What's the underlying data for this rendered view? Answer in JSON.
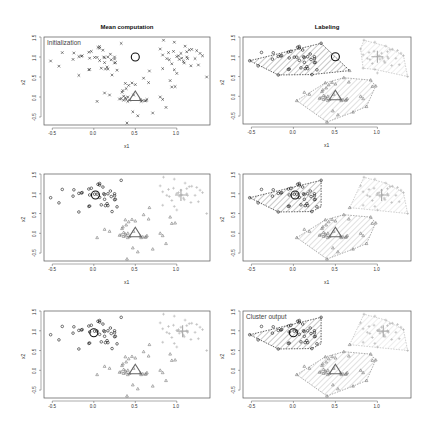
{
  "figure": {
    "column_titles": [
      "Mean computation",
      "Labeling"
    ],
    "panel_labels": {
      "initialization": "Initialization",
      "output": "Cluster output"
    },
    "xlabel": "x1",
    "ylabel": "x2",
    "bottom_left_xlabel": "-",
    "bottom_right_xlabel": "-"
  },
  "chart_data": [
    {
      "type": "scatter",
      "title": "Mean computation",
      "subtitle": "Initialization",
      "xlabel": "x1",
      "ylabel": "x2",
      "xlim": [
        -0.6,
        1.4
      ],
      "ylim": [
        -0.7,
        1.5
      ],
      "xticks": [
        -0.5,
        0.0,
        0.5,
        1.0
      ],
      "yticks": [
        -0.5,
        0.0,
        0.5,
        1.0,
        1.5
      ],
      "point_style": "unlabeled-x",
      "centroids": [
        {
          "x": 0.5,
          "y": 1.0,
          "marker": "circle"
        },
        {
          "x": 0.5,
          "y": 0.0,
          "marker": "triangle"
        }
      ]
    },
    {
      "type": "scatter",
      "title": "Labeling",
      "xlabel": "x1",
      "ylabel": "x2",
      "xlim": [
        -0.6,
        1.4
      ],
      "ylim": [
        -0.7,
        1.5
      ],
      "hulls": true,
      "centroids": [
        {
          "x": 0.5,
          "y": 1.0,
          "marker": "circle"
        },
        {
          "x": 0.5,
          "y": 0.0,
          "marker": "triangle"
        },
        {
          "x": 1.0,
          "y": 1.0,
          "marker": "plus"
        }
      ]
    },
    {
      "type": "scatter",
      "xlabel": "x1",
      "ylabel": "x2",
      "xlim": [
        -0.6,
        1.4
      ],
      "ylim": [
        -0.7,
        1.5
      ],
      "centroids": [
        {
          "x": 0.02,
          "y": 0.97,
          "marker": "circle"
        },
        {
          "x": 0.5,
          "y": 0.0,
          "marker": "triangle"
        },
        {
          "x": 1.05,
          "y": 0.97,
          "marker": "plus"
        }
      ]
    },
    {
      "type": "scatter",
      "xlabel": "x1",
      "ylabel": "x2",
      "xlim": [
        -0.6,
        1.4
      ],
      "ylim": [
        -0.7,
        1.5
      ],
      "hulls": true,
      "centroids": [
        {
          "x": 0.02,
          "y": 0.97,
          "marker": "circle"
        },
        {
          "x": 0.5,
          "y": 0.0,
          "marker": "triangle"
        },
        {
          "x": 1.05,
          "y": 0.97,
          "marker": "plus"
        }
      ]
    },
    {
      "type": "scatter",
      "xlabel": "",
      "ylabel": "x2",
      "xlim": [
        -0.6,
        1.4
      ],
      "ylim": [
        -0.7,
        1.5
      ],
      "centroids": [
        {
          "x": 0.0,
          "y": 0.95,
          "marker": "circle"
        },
        {
          "x": 0.5,
          "y": 0.0,
          "marker": "triangle"
        },
        {
          "x": 1.07,
          "y": 0.99,
          "marker": "plus"
        }
      ]
    },
    {
      "type": "scatter",
      "title": "",
      "subtitle": "Cluster output",
      "xlabel": "",
      "ylabel": "x2",
      "xlim": [
        -0.6,
        1.4
      ],
      "ylim": [
        -0.7,
        1.5
      ],
      "hulls": true,
      "centroids": [
        {
          "x": 0.0,
          "y": 0.95,
          "marker": "circle"
        },
        {
          "x": 0.5,
          "y": 0.0,
          "marker": "triangle"
        },
        {
          "x": 1.07,
          "y": 0.99,
          "marker": "plus"
        }
      ]
    }
  ],
  "points": [
    [
      -0.52,
      0.9,
      0
    ],
    [
      -0.42,
      0.77,
      0
    ],
    [
      -0.38,
      1.11,
      0
    ],
    [
      -0.25,
      0.94,
      0
    ],
    [
      -0.24,
      1.1,
      0
    ],
    [
      -0.18,
      1.01,
      0
    ],
    [
      -0.15,
      1.02,
      0
    ],
    [
      -0.14,
      1.03,
      0
    ],
    [
      -0.18,
      0.54,
      0
    ],
    [
      -0.06,
      1.12,
      0
    ],
    [
      -0.03,
      1.14,
      0
    ],
    [
      -0.05,
      0.97,
      0
    ],
    [
      -0.05,
      0.69,
      0
    ],
    [
      -0.06,
      0.68,
      0
    ],
    [
      0.01,
      0.99,
      0
    ],
    [
      0.04,
      0.99,
      0
    ],
    [
      0.05,
      1.24,
      0
    ],
    [
      0.07,
      1.26,
      0
    ],
    [
      0.07,
      1.22,
      0
    ],
    [
      0.09,
      0.72,
      0
    ],
    [
      0.11,
      1.17,
      0
    ],
    [
      0.12,
      1.0,
      0
    ],
    [
      0.13,
      0.98,
      0
    ],
    [
      0.13,
      0.86,
      0
    ],
    [
      0.14,
      0.7,
      0
    ],
    [
      0.16,
      0.75,
      0
    ],
    [
      0.17,
      0.7,
      0
    ],
    [
      0.17,
      1.0,
      0
    ],
    [
      0.2,
      1.07,
      0
    ],
    [
      0.21,
      0.93,
      0
    ],
    [
      0.25,
      1.0,
      0
    ],
    [
      0.25,
      0.95,
      0
    ],
    [
      0.26,
      0.86,
      0
    ],
    [
      0.25,
      0.85,
      0
    ],
    [
      0.28,
      0.67,
      0
    ],
    [
      0.33,
      1.34,
      0
    ],
    [
      0.07,
      0.91,
      0
    ],
    [
      0.22,
      0.55,
      0
    ],
    [
      0.04,
      -0.11,
      1
    ],
    [
      0.13,
      0.1,
      1
    ],
    [
      0.19,
      0.05,
      1
    ],
    [
      0.31,
      -0.05,
      1
    ],
    [
      0.33,
      -0.04,
      1
    ],
    [
      0.34,
      0.12,
      1
    ],
    [
      0.35,
      0.16,
      1
    ],
    [
      0.36,
      0.02,
      1
    ],
    [
      0.36,
      -0.08,
      1
    ],
    [
      0.38,
      0.34,
      1
    ],
    [
      0.38,
      -0.02,
      1
    ],
    [
      0.39,
      -0.06,
      1
    ],
    [
      0.39,
      0.21,
      1
    ],
    [
      0.41,
      0.0,
      1
    ],
    [
      0.41,
      -0.11,
      1
    ],
    [
      0.43,
      -0.08,
      1
    ],
    [
      0.46,
      0.35,
      1
    ],
    [
      0.47,
      -0.37,
      1
    ],
    [
      0.48,
      0.05,
      1
    ],
    [
      0.5,
      0.31,
      1
    ],
    [
      0.53,
      -0.47,
      1
    ],
    [
      0.56,
      -0.07,
      1
    ],
    [
      0.57,
      -0.11,
      1
    ],
    [
      0.59,
      -0.09,
      1
    ],
    [
      0.6,
      0.47,
      1
    ],
    [
      0.62,
      -0.1,
      1
    ],
    [
      0.64,
      -0.06,
      1
    ],
    [
      0.66,
      0.36,
      1
    ],
    [
      0.67,
      0.65,
      1
    ],
    [
      0.71,
      -0.4,
      1
    ],
    [
      0.4,
      -0.65,
      1
    ],
    [
      0.63,
      -0.09,
      1
    ],
    [
      0.42,
      0.29,
      1
    ],
    [
      0.8,
      0.0,
      1
    ],
    [
      0.83,
      -0.06,
      1
    ],
    [
      0.87,
      -0.26,
      1
    ],
    [
      0.8,
      1.2,
      2
    ],
    [
      0.83,
      1.05,
      2
    ],
    [
      0.84,
      1.42,
      2
    ],
    [
      0.88,
      0.96,
      2
    ],
    [
      0.9,
      1.11,
      2
    ],
    [
      0.91,
      0.93,
      2
    ],
    [
      0.83,
      0.71,
      2
    ],
    [
      0.94,
      0.83,
      2
    ],
    [
      0.96,
      1.14,
      2
    ],
    [
      0.97,
      1.37,
      2
    ],
    [
      1.0,
      1.01,
      2
    ],
    [
      1.02,
      1.03,
      2
    ],
    [
      1.03,
      0.94,
      2
    ],
    [
      1.05,
      1.09,
      2
    ],
    [
      1.06,
      0.97,
      2
    ],
    [
      1.08,
      0.89,
      2
    ],
    [
      1.09,
      0.85,
      2
    ],
    [
      1.1,
      1.27,
      2
    ],
    [
      1.12,
      1.0,
      2
    ],
    [
      1.13,
      0.96,
      2
    ],
    [
      1.15,
      1.18,
      2
    ],
    [
      1.17,
      0.78,
      2
    ],
    [
      1.22,
      0.96,
      2
    ],
    [
      1.24,
      1.16,
      2
    ],
    [
      1.26,
      0.8,
      2
    ],
    [
      1.28,
      1.09,
      2
    ],
    [
      1.31,
      1.03,
      2
    ],
    [
      1.36,
      0.5,
      2
    ],
    [
      0.92,
      0.41,
      1
    ],
    [
      0.94,
      0.25,
      1
    ],
    [
      0.98,
      0.26,
      1
    ],
    [
      0.97,
      0.68,
      2
    ],
    [
      1.0,
      0.59,
      2
    ],
    [
      1.12,
      1.13,
      2
    ],
    [
      1.18,
      1.19,
      2
    ]
  ],
  "hulls": {
    "top_row": [
      [
        [
          -0.52,
          0.9
        ],
        [
          0.33,
          1.34
        ],
        [
          0.67,
          0.65
        ],
        [
          0.22,
          0.55
        ],
        [
          -0.18,
          0.54
        ]
      ],
      [
        [
          0.04,
          -0.11
        ],
        [
          0.38,
          0.34
        ],
        [
          0.6,
          0.47
        ],
        [
          0.92,
          0.41
        ],
        [
          0.98,
          0.26
        ],
        [
          0.87,
          -0.26
        ],
        [
          0.71,
          -0.4
        ],
        [
          0.4,
          -0.65
        ]
      ],
      [
        [
          0.8,
          1.2
        ],
        [
          0.84,
          1.42
        ],
        [
          1.1,
          1.27
        ],
        [
          1.31,
          1.03
        ],
        [
          1.36,
          0.5
        ],
        [
          0.97,
          0.68
        ],
        [
          0.83,
          0.71
        ]
      ]
    ],
    "other_rows": [
      [
        [
          -0.52,
          0.9
        ],
        [
          0.33,
          1.34
        ],
        [
          0.33,
          0.67
        ],
        [
          0.22,
          0.55
        ],
        [
          -0.18,
          0.54
        ]
      ],
      [
        [
          0.04,
          -0.11
        ],
        [
          0.38,
          0.34
        ],
        [
          0.6,
          0.47
        ],
        [
          0.92,
          0.41
        ],
        [
          0.98,
          0.26
        ],
        [
          0.87,
          -0.26
        ],
        [
          0.71,
          -0.4
        ],
        [
          0.4,
          -0.65
        ]
      ],
      [
        [
          0.67,
          0.65
        ],
        [
          0.84,
          1.42
        ],
        [
          1.1,
          1.27
        ],
        [
          1.31,
          1.03
        ],
        [
          1.36,
          0.5
        ]
      ]
    ]
  },
  "colors": {
    "cluster0": "#1a1a1a",
    "cluster1": "#7a7a7a",
    "cluster2": "#b4b4b4",
    "frame": "#555555",
    "hull0": "#222222",
    "hull1": "#888888",
    "hull2": "#bbbbbb"
  }
}
